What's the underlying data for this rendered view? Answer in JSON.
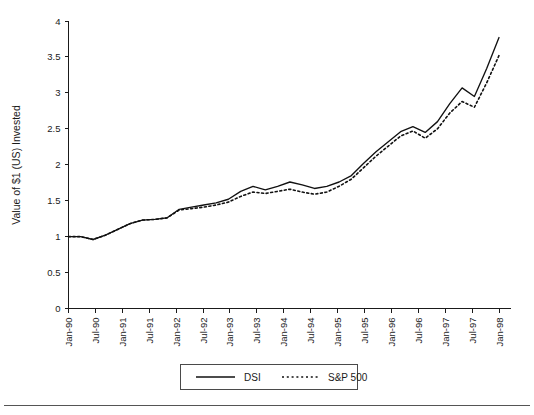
{
  "chart_data": {
    "type": "line",
    "title": "",
    "xlabel": "",
    "ylabel": "Value of $1 (US) Invested",
    "ylim": [
      0,
      4
    ],
    "ytick_values": [
      0,
      0.5,
      1,
      1.5,
      2,
      2.5,
      3,
      3.5,
      4
    ],
    "ytick_labels": [
      "0",
      "0.5",
      "1",
      "1.5",
      "2",
      "2.5",
      "3",
      "3.5",
      "4"
    ],
    "grid": false,
    "legend_position": "bottom-center",
    "x": [
      "Jan-90",
      "Jul-90",
      "Jan-91",
      "Jul-91",
      "Jan-92",
      "Jul-92",
      "Jan-93",
      "Jul-93",
      "Jan-94",
      "Jul-94",
      "Jan-95",
      "Jul-95",
      "Jan-96",
      "Jul-96",
      "Jan-97",
      "Jul-97",
      "Jan-98"
    ],
    "x_tick_labels": [
      "Jan-90",
      "Jul-90",
      "Jan-91",
      "Jul-91",
      "Jan-92",
      "Jul-92",
      "Jan-93",
      "Jul-93",
      "Jan-94",
      "Jul-94",
      "Jan-95",
      "Jul-95",
      "Jan-96",
      "Jul-96",
      "Jan-97",
      "Jul-97",
      "Jan-98"
    ],
    "series": [
      {
        "name": "DSI",
        "style": "solid",
        "color": "#111111",
        "values_quarterly": [
          1.0,
          1.0,
          0.96,
          1.02,
          1.1,
          1.18,
          1.23,
          1.24,
          1.26,
          1.38,
          1.41,
          1.44,
          1.47,
          1.52,
          1.63,
          1.7,
          1.65,
          1.7,
          1.76,
          1.72,
          1.67,
          1.7,
          1.76,
          1.85,
          2.02,
          2.18,
          2.32,
          2.46,
          2.53,
          2.45,
          2.6,
          2.85,
          3.07,
          2.95,
          3.34,
          3.77
        ],
        "values_semiannual": [
          1.0,
          0.96,
          1.1,
          1.23,
          1.26,
          1.41,
          1.47,
          1.63,
          1.65,
          1.76,
          1.67,
          1.76,
          2.02,
          2.32,
          2.53,
          2.6,
          3.77
        ]
      },
      {
        "name": "S&P 500",
        "style": "dotted",
        "color": "#111111",
        "values_quarterly": [
          1.0,
          1.0,
          0.96,
          1.02,
          1.1,
          1.18,
          1.23,
          1.24,
          1.26,
          1.37,
          1.39,
          1.41,
          1.44,
          1.48,
          1.56,
          1.62,
          1.6,
          1.63,
          1.66,
          1.62,
          1.59,
          1.62,
          1.7,
          1.8,
          1.96,
          2.12,
          2.26,
          2.4,
          2.47,
          2.37,
          2.5,
          2.72,
          2.88,
          2.8,
          3.14,
          3.52
        ],
        "values_semiannual": [
          1.0,
          0.96,
          1.1,
          1.23,
          1.26,
          1.39,
          1.44,
          1.56,
          1.6,
          1.66,
          1.59,
          1.7,
          1.96,
          2.26,
          2.47,
          2.5,
          3.52
        ]
      }
    ],
    "legend": [
      {
        "label": "DSI",
        "style": "solid"
      },
      {
        "label": "S&P 500",
        "style": "dotted"
      }
    ]
  }
}
